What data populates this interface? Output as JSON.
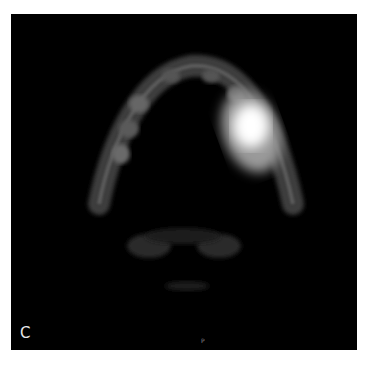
{
  "figure": {
    "panel_label": "C",
    "bottom_marker": "P",
    "colors": {
      "background": "#000000",
      "page": "#ffffff",
      "hotspot": "#ffffff"
    }
  }
}
